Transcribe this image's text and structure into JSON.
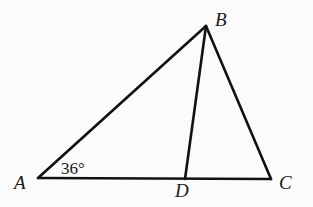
{
  "diagram": {
    "type": "geometry-triangle",
    "background": "#fbfbfb",
    "stroke_color": "#111111",
    "points": {
      "A": {
        "label": "A",
        "x": 38,
        "y": 178,
        "label_x": 14,
        "label_y": 189
      },
      "B": {
        "label": "B",
        "x": 206,
        "y": 26,
        "label_x": 215,
        "label_y": 26
      },
      "C": {
        "label": "C",
        "x": 271,
        "y": 179,
        "label_x": 279,
        "label_y": 189
      },
      "D": {
        "label": "D",
        "x": 185,
        "y": 179,
        "label_x": 175,
        "label_y": 197
      }
    },
    "segments": [
      {
        "from": "A",
        "to": "B"
      },
      {
        "from": "B",
        "to": "C"
      },
      {
        "from": "A",
        "to": "C"
      },
      {
        "from": "B",
        "to": "D"
      }
    ],
    "angle_annotation": {
      "vertex": "A",
      "text": "36°",
      "x": 61,
      "y": 174
    }
  }
}
